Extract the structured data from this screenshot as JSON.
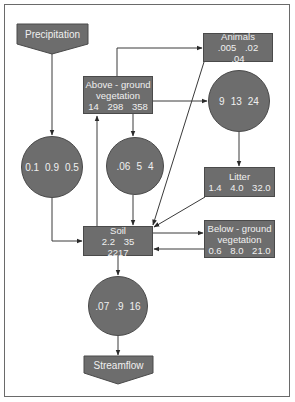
{
  "diagram": {
    "colors": {
      "node_fill": "#6d6d6d",
      "node_text": "#f0f0f0",
      "line": "#3a3a3a",
      "frame": "#6a6a6a"
    },
    "sources": {
      "precipitation": {
        "label": "Precipitation"
      }
    },
    "sinks": {
      "streamflow": {
        "label": "Streamflow"
      }
    },
    "pools": {
      "above_ground": {
        "title_line1": "Above - ground",
        "title_line2": "vegetation",
        "values": [
          "14",
          "298",
          "358"
        ]
      },
      "animals": {
        "title": "Animals",
        "values": [
          ".005",
          ".02",
          ".04"
        ]
      },
      "litter": {
        "title": "Litter",
        "values": [
          "1.4",
          "4.0",
          "32.0"
        ]
      },
      "soil": {
        "title": "Soil",
        "values": [
          "2.2",
          "35",
          "2217"
        ]
      },
      "below_ground": {
        "title_line1": "Below - ground",
        "title_line2": "vegetation",
        "values": [
          "0.6",
          "8.0",
          "21.0"
        ]
      }
    },
    "fluxes": {
      "precip_to_soil": {
        "values": [
          "0.1",
          "0.9",
          "0.5"
        ]
      },
      "vegetation_to_litter": {
        "values": [
          "9",
          "13",
          "24"
        ]
      },
      "vegetation_to_soil": {
        "values": [
          ".06",
          "5",
          "4"
        ]
      },
      "soil_to_streamflow": {
        "values": [
          ".07",
          ".9",
          "16"
        ]
      }
    },
    "edges": [
      {
        "from": "precipitation",
        "to": "flux_precip_to_soil"
      },
      {
        "from": "flux_precip_to_soil",
        "to": "soil"
      },
      {
        "from": "above_ground",
        "to": "animals"
      },
      {
        "from": "above_ground",
        "to": "flux_vegetation_to_litter"
      },
      {
        "from": "above_ground",
        "to": "flux_vegetation_to_soil"
      },
      {
        "from": "soil",
        "to": "above_ground"
      },
      {
        "from": "flux_vegetation_to_litter",
        "to": "litter"
      },
      {
        "from": "animals",
        "to": "soil"
      },
      {
        "from": "litter",
        "to": "soil"
      },
      {
        "from": "flux_vegetation_to_soil",
        "to": "soil"
      },
      {
        "from": "soil",
        "to": "below_ground"
      },
      {
        "from": "below_ground",
        "to": "soil"
      },
      {
        "from": "soil",
        "to": "flux_soil_to_streamflow"
      },
      {
        "from": "flux_soil_to_streamflow",
        "to": "streamflow"
      }
    ]
  }
}
